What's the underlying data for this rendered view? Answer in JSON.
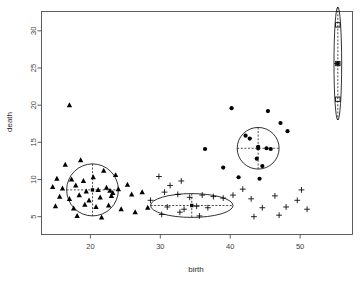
{
  "chart_data": {
    "type": "scatter",
    "title": "",
    "xlabel": "birth",
    "ylabel": "death",
    "xlim": [
      13.0,
      57.5
    ],
    "ylim": [
      2.6,
      32.6
    ],
    "xticks": [
      20,
      30,
      40,
      50
    ],
    "yticks": [
      5,
      10,
      15,
      20,
      25,
      30
    ],
    "grid": false,
    "legend": false,
    "legend_position": "none",
    "series": [
      {
        "name": "cluster-1",
        "marker": "triangle",
        "color": "#000000",
        "points": [
          [
            17.0,
            20.0
          ],
          [
            16.4,
            12.0
          ],
          [
            18.6,
            12.6
          ],
          [
            21.9,
            11.2
          ],
          [
            15.2,
            10.1
          ],
          [
            17.3,
            10.0
          ],
          [
            19.0,
            9.8
          ],
          [
            20.4,
            10.3
          ],
          [
            23.6,
            10.6
          ],
          [
            25.3,
            9.3
          ],
          [
            14.6,
            9.0
          ],
          [
            16.0,
            8.8
          ],
          [
            17.9,
            9.2
          ],
          [
            19.4,
            8.4
          ],
          [
            21.1,
            8.6
          ],
          [
            22.3,
            8.9
          ],
          [
            22.8,
            8.5
          ],
          [
            23.2,
            8.2
          ],
          [
            24.0,
            8.7
          ],
          [
            15.6,
            7.7
          ],
          [
            17.0,
            7.4
          ],
          [
            18.4,
            7.9
          ],
          [
            19.8,
            7.2
          ],
          [
            21.4,
            7.6
          ],
          [
            23.0,
            7.8
          ],
          [
            25.9,
            8.0
          ],
          [
            27.4,
            8.3
          ],
          [
            15.0,
            6.4
          ],
          [
            17.6,
            6.1
          ],
          [
            19.2,
            6.6
          ],
          [
            20.8,
            6.3
          ],
          [
            22.6,
            6.5
          ],
          [
            24.4,
            6.0
          ],
          [
            18.1,
            5.1
          ],
          [
            21.6,
            4.9
          ],
          [
            26.4,
            5.6
          ],
          [
            28.2,
            6.2
          ]
        ]
      },
      {
        "name": "cluster-2",
        "marker": "plus",
        "color": "#000000",
        "points": [
          [
            29.8,
            10.4
          ],
          [
            31.4,
            9.2
          ],
          [
            33.0,
            9.8
          ],
          [
            30.6,
            8.3
          ],
          [
            32.5,
            8.0
          ],
          [
            34.2,
            7.6
          ],
          [
            36.0,
            7.9
          ],
          [
            37.6,
            7.7
          ],
          [
            39.0,
            7.5
          ],
          [
            40.4,
            7.9
          ],
          [
            28.6,
            7.2
          ],
          [
            31.0,
            6.3
          ],
          [
            33.4,
            6.0
          ],
          [
            35.2,
            6.4
          ],
          [
            36.8,
            6.2
          ],
          [
            30.2,
            5.3
          ],
          [
            32.8,
            5.6
          ],
          [
            35.6,
            5.1
          ],
          [
            41.8,
            8.7
          ],
          [
            43.0,
            7.4
          ],
          [
            44.6,
            6.2
          ],
          [
            46.4,
            7.8
          ],
          [
            48.0,
            6.3
          ],
          [
            49.6,
            7.2
          ],
          [
            51.0,
            6.0
          ],
          [
            43.4,
            5.0
          ],
          [
            47.0,
            5.2
          ],
          [
            50.2,
            8.6
          ]
        ]
      },
      {
        "name": "cluster-3",
        "marker": "circle",
        "color": "#000000",
        "points": [
          [
            40.2,
            19.6
          ],
          [
            45.4,
            19.2
          ],
          [
            47.2,
            17.6
          ],
          [
            42.2,
            15.9
          ],
          [
            42.8,
            15.5
          ],
          [
            44.0,
            14.4
          ],
          [
            45.2,
            14.2
          ],
          [
            45.8,
            14.1
          ],
          [
            43.8,
            12.8
          ],
          [
            44.6,
            11.8
          ],
          [
            36.4,
            14.1
          ],
          [
            39.0,
            11.6
          ],
          [
            41.2,
            10.3
          ],
          [
            44.2,
            10.1
          ],
          [
            48.2,
            16.5
          ]
        ]
      },
      {
        "name": "cluster-4",
        "marker": "square",
        "color": "#000000",
        "points": [
          [
            55.4,
            30.8
          ],
          [
            55.4,
            25.6
          ],
          [
            55.4,
            20.8
          ]
        ]
      }
    ],
    "cluster_ellipses": [
      {
        "name": "ellipse-cluster-1",
        "center": [
          20.3,
          8.6
        ],
        "rx": 3.7,
        "ry": 3.5,
        "shape": "circle"
      },
      {
        "name": "ellipse-cluster-2",
        "center": [
          34.5,
          6.5
        ],
        "rx": 5.9,
        "ry": 1.6,
        "shape": "ellipse"
      },
      {
        "name": "ellipse-cluster-3",
        "center": [
          44.0,
          14.2
        ],
        "rx": 3.0,
        "ry": 2.8,
        "shape": "circle"
      },
      {
        "name": "ellipse-cluster-4",
        "center": [
          55.4,
          25.6
        ],
        "rx": 0.55,
        "ry": 7.6,
        "shape": "ellipse"
      }
    ]
  },
  "axis": {
    "x_title": "birth",
    "y_title": "death",
    "x_tick_labels": [
      "20",
      "30",
      "40",
      "50"
    ],
    "y_tick_labels": [
      "5",
      "10",
      "15",
      "20",
      "25",
      "30"
    ]
  },
  "colors": {
    "marker": "#000000",
    "axis": "#4d4d4d",
    "background": "#ffffff",
    "cluster_outline": "#000000"
  }
}
